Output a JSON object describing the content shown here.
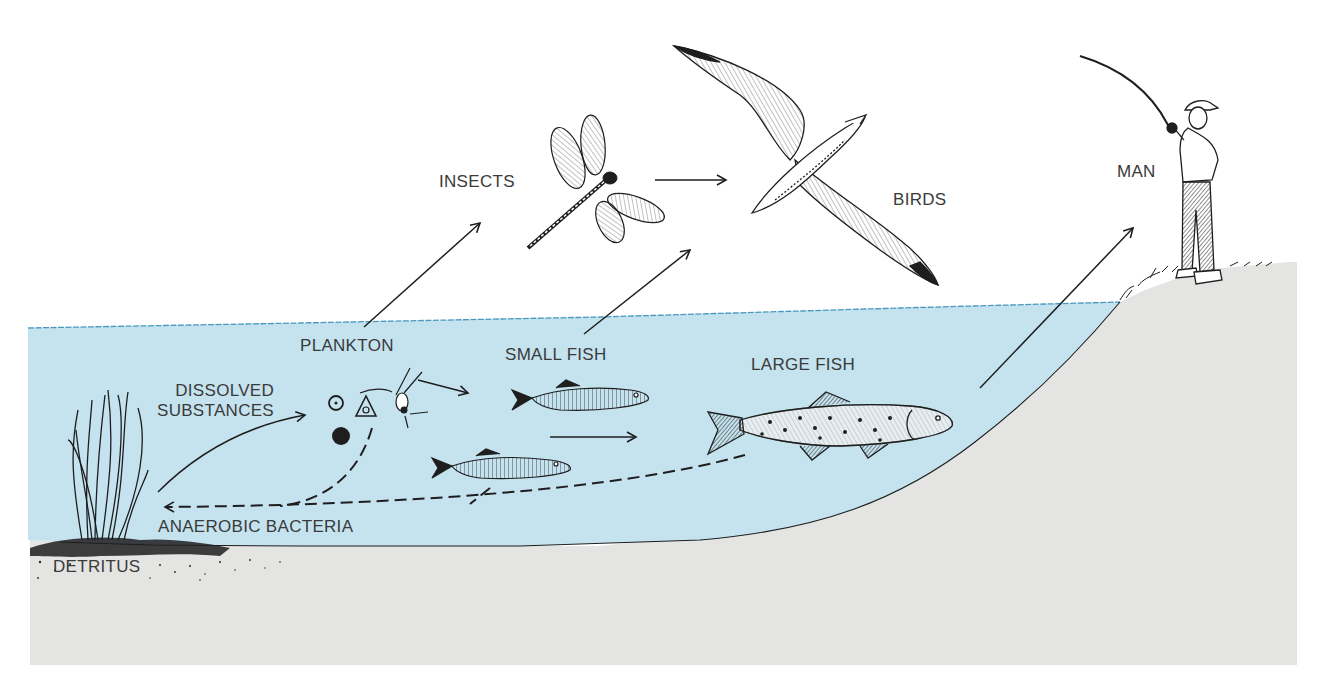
{
  "diagram": {
    "type": "aquatic food chain / nutrient cycle",
    "colors": {
      "water": "#c5e3ef",
      "water_surface_line": "#4a98c0",
      "ground": "#e4e4e2",
      "ink": "#1e1e1e",
      "label_text": "#3a3a3a",
      "background": "#ffffff"
    },
    "labels": {
      "insects": "INSECTS",
      "birds": "BIRDS",
      "man": "MAN",
      "plankton": "PLANKTON",
      "small_fish": "SMALL FISH",
      "large_fish": "LARGE FISH",
      "dissolved_substances": "DISSOLVED\nSUBSTANCES",
      "anaerobic_bacteria": "ANAEROBIC BACTERIA",
      "detritus": "DETRITUS"
    },
    "nodes": [
      {
        "id": "detritus",
        "label": "DETRITUS",
        "icon": "water-plant-icon"
      },
      {
        "id": "dissolved_substances",
        "label": "DISSOLVED SUBSTANCES"
      },
      {
        "id": "plankton",
        "label": "PLANKTON",
        "icon": "plankton-icon"
      },
      {
        "id": "insects",
        "label": "INSECTS",
        "icon": "dragonfly-icon"
      },
      {
        "id": "small_fish",
        "label": "SMALL FISH",
        "icon": "small-fish-icon"
      },
      {
        "id": "large_fish",
        "label": "LARGE FISH",
        "icon": "large-fish-icon"
      },
      {
        "id": "birds",
        "label": "BIRDS",
        "icon": "albatross-icon"
      },
      {
        "id": "man",
        "label": "MAN",
        "icon": "fisherman-icon"
      },
      {
        "id": "anaerobic_bacteria",
        "label": "ANAEROBIC BACTERIA"
      }
    ],
    "edges": [
      {
        "from": "detritus",
        "to": "dissolved_substances",
        "style": "solid"
      },
      {
        "from": "plankton",
        "to": "insects",
        "style": "solid"
      },
      {
        "from": "plankton",
        "to": "small_fish",
        "style": "solid"
      },
      {
        "from": "insects",
        "to": "birds",
        "style": "solid"
      },
      {
        "from": "small_fish",
        "to": "birds",
        "style": "solid"
      },
      {
        "from": "small_fish",
        "to": "large_fish",
        "style": "solid"
      },
      {
        "from": "large_fish",
        "to": "man",
        "style": "solid"
      },
      {
        "from": "plankton",
        "to": "detritus",
        "style": "dashed",
        "via": "anaerobic_bacteria"
      },
      {
        "from": "small_fish",
        "to": "detritus",
        "style": "dashed",
        "via": "anaerobic_bacteria"
      },
      {
        "from": "large_fish",
        "to": "detritus",
        "style": "dashed",
        "via": "anaerobic_bacteria"
      }
    ]
  }
}
